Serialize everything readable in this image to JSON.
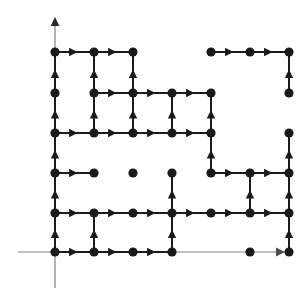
{
  "figure": {
    "title": ""
  },
  "chart_data": {
    "type": "scatter",
    "title": "",
    "xlabel": "",
    "ylabel": "",
    "xlim": [
      0,
      6
    ],
    "ylim": [
      0,
      5
    ],
    "grid": false,
    "legend": null,
    "colors": {
      "node": "#1a1a1a",
      "edge": "#1a1a1a",
      "axis": "#808080",
      "background": "#ffffff"
    },
    "geometry": {
      "columns_px": [
        55,
        94,
        133,
        172,
        211,
        250
      ],
      "rows_px": [
        52,
        93,
        133,
        173,
        213,
        252
      ],
      "origin_px": [
        55,
        252
      ],
      "x_axis_y_px": 252,
      "y_axis_x_px": 55,
      "x_axis_arrow_tip_px": [
        285,
        252
      ],
      "y_axis_arrow_tip_px": [
        55,
        17
      ],
      "y_axis_bottom_px": 288,
      "x_axis_left_px": 18,
      "node_radius_px": 4.6,
      "edge_width_px": 2.0,
      "axis_width_px": 1.2
    },
    "nodes": [
      {
        "col": 0,
        "row": 0
      },
      {
        "col": 1,
        "row": 0
      },
      {
        "col": 2,
        "row": 0
      },
      {
        "col": 4,
        "row": 0
      },
      {
        "col": 5,
        "row": 0
      },
      {
        "col": 6,
        "row": 0
      },
      {
        "col": 0,
        "row": 1
      },
      {
        "col": 1,
        "row": 1
      },
      {
        "col": 2,
        "row": 1
      },
      {
        "col": 3,
        "row": 1
      },
      {
        "col": 4,
        "row": 1
      },
      {
        "col": 6,
        "row": 1
      },
      {
        "col": 0,
        "row": 2
      },
      {
        "col": 1,
        "row": 2
      },
      {
        "col": 2,
        "row": 2
      },
      {
        "col": 3,
        "row": 2
      },
      {
        "col": 4,
        "row": 2
      },
      {
        "col": 6,
        "row": 2
      },
      {
        "col": 0,
        "row": 3
      },
      {
        "col": 1,
        "row": 3
      },
      {
        "col": 2,
        "row": 3
      },
      {
        "col": 3,
        "row": 3
      },
      {
        "col": 4,
        "row": 3
      },
      {
        "col": 5,
        "row": 3
      },
      {
        "col": 6,
        "row": 3
      },
      {
        "col": 0,
        "row": 4
      },
      {
        "col": 1,
        "row": 4
      },
      {
        "col": 2,
        "row": 4
      },
      {
        "col": 3,
        "row": 4
      },
      {
        "col": 4,
        "row": 4
      },
      {
        "col": 5,
        "row": 4
      },
      {
        "col": 6,
        "row": 4
      },
      {
        "col": 0,
        "row": 5
      },
      {
        "col": 1,
        "row": 5
      },
      {
        "col": 2,
        "row": 5
      },
      {
        "col": 3,
        "row": 5
      },
      {
        "col": 5,
        "row": 5
      },
      {
        "col": 6,
        "row": 5
      }
    ],
    "horizontal_edges": [
      {
        "col": 0,
        "row": 0,
        "dir": "right"
      },
      {
        "col": 1,
        "row": 0,
        "dir": "right"
      },
      {
        "col": 4,
        "row": 0,
        "dir": "right"
      },
      {
        "col": 5,
        "row": 0,
        "dir": "right"
      },
      {
        "col": 1,
        "row": 1,
        "dir": "right"
      },
      {
        "col": 2,
        "row": 1,
        "dir": "right"
      },
      {
        "col": 3,
        "row": 1,
        "dir": "right"
      },
      {
        "col": 0,
        "row": 2,
        "dir": "right"
      },
      {
        "col": 1,
        "row": 2,
        "dir": "right"
      },
      {
        "col": 2,
        "row": 2,
        "dir": "right"
      },
      {
        "col": 3,
        "row": 2,
        "dir": "right"
      },
      {
        "col": 0,
        "row": 3,
        "dir": "right"
      },
      {
        "col": 4,
        "row": 3,
        "dir": "right"
      },
      {
        "col": 5,
        "row": 3,
        "dir": "right"
      },
      {
        "col": 0,
        "row": 4,
        "dir": "right"
      },
      {
        "col": 1,
        "row": 4,
        "dir": "right"
      },
      {
        "col": 2,
        "row": 4,
        "dir": "right"
      },
      {
        "col": 3,
        "row": 4,
        "dir": "right"
      },
      {
        "col": 4,
        "row": 4,
        "dir": "right"
      },
      {
        "col": 5,
        "row": 4,
        "dir": "right"
      },
      {
        "col": 0,
        "row": 5,
        "dir": "right"
      },
      {
        "col": 1,
        "row": 5,
        "dir": "right"
      },
      {
        "col": 2,
        "row": 5,
        "dir": "right"
      }
    ],
    "vertical_edges": [
      {
        "col": 0,
        "row": 1,
        "dir": "up"
      },
      {
        "col": 0,
        "row": 2,
        "dir": "up"
      },
      {
        "col": 0,
        "row": 3,
        "dir": "up"
      },
      {
        "col": 0,
        "row": 4,
        "dir": "up"
      },
      {
        "col": 0,
        "row": 5,
        "dir": "up"
      },
      {
        "col": 1,
        "row": 1,
        "dir": "up"
      },
      {
        "col": 1,
        "row": 2,
        "dir": "up"
      },
      {
        "col": 1,
        "row": 5,
        "dir": "up"
      },
      {
        "col": 2,
        "row": 1,
        "dir": "up"
      },
      {
        "col": 2,
        "row": 2,
        "dir": "up"
      },
      {
        "col": 3,
        "row": 2,
        "dir": "up"
      },
      {
        "col": 3,
        "row": 4,
        "dir": "up"
      },
      {
        "col": 3,
        "row": 5,
        "dir": "up"
      },
      {
        "col": 4,
        "row": 2,
        "dir": "up"
      },
      {
        "col": 4,
        "row": 3,
        "dir": "up"
      },
      {
        "col": 5,
        "row": 4,
        "dir": "up"
      },
      {
        "col": 6,
        "row": 1,
        "dir": "up"
      },
      {
        "col": 6,
        "row": 3,
        "dir": "up"
      },
      {
        "col": 6,
        "row": 4,
        "dir": "up"
      },
      {
        "col": 6,
        "row": 5,
        "dir": "up"
      }
    ],
    "counts": {
      "nodes": 38,
      "horizontal_edges": 23,
      "vertical_edges": 20,
      "columns": 7,
      "rows": 6
    }
  }
}
